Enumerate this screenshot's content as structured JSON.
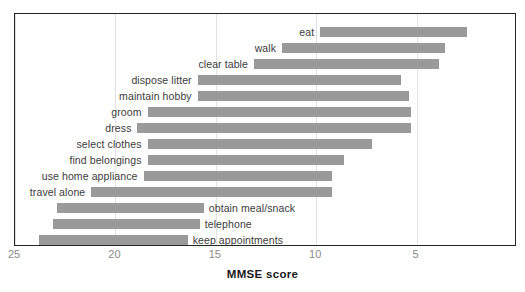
{
  "chart_data": {
    "type": "bar",
    "orientation": "horizontal-range",
    "title": "",
    "subtitle": "",
    "xlabel": "MMSE score",
    "ylabel": "",
    "xlim": [
      25,
      0
    ],
    "x_axis_reversed": true,
    "xticks": [
      25,
      20,
      15,
      10,
      5
    ],
    "xtick_labels": [
      "25",
      "20",
      "15",
      "10",
      "5"
    ],
    "grid": true,
    "grid_axis": "x",
    "legend": null,
    "bar_color": "#9a9a9a",
    "frame_color": "#262626",
    "gridline_color": "#e2e2e2",
    "categories": [
      "eat",
      "walk",
      "clear table",
      "dispose litter",
      "maintain hobby",
      "groom",
      "dress",
      "select clothes",
      "find belongings",
      "use home appliance",
      "travel alone",
      "obtain meal/snack",
      "telephone",
      "keep appointments"
    ],
    "bars": [
      {
        "label": "eat",
        "start": 9.8,
        "end": 2.5,
        "label_side": "left"
      },
      {
        "label": "walk",
        "start": 11.7,
        "end": 3.6,
        "label_side": "left"
      },
      {
        "label": "clear table",
        "start": 13.1,
        "end": 3.9,
        "label_side": "left"
      },
      {
        "label": "dispose litter",
        "start": 15.9,
        "end": 5.8,
        "label_side": "left"
      },
      {
        "label": "maintain hobby",
        "start": 15.9,
        "end": 5.4,
        "label_side": "left"
      },
      {
        "label": "groom",
        "start": 18.4,
        "end": 5.3,
        "label_side": "left"
      },
      {
        "label": "dress",
        "start": 18.9,
        "end": 5.3,
        "label_side": "left"
      },
      {
        "label": "select clothes",
        "start": 18.4,
        "end": 7.2,
        "label_side": "left"
      },
      {
        "label": "find belongings",
        "start": 18.4,
        "end": 8.6,
        "label_side": "left"
      },
      {
        "label": "use home appliance",
        "start": 18.6,
        "end": 9.2,
        "label_side": "left"
      },
      {
        "label": "travel alone",
        "start": 21.2,
        "end": 9.2,
        "label_side": "left"
      },
      {
        "label": "obtain meal/snack",
        "start": 22.9,
        "end": 15.6,
        "label_side": "right"
      },
      {
        "label": "telephone",
        "start": 23.1,
        "end": 15.8,
        "label_side": "right"
      },
      {
        "label": "keep appointments",
        "start": 23.8,
        "end": 16.4,
        "label_side": "right"
      }
    ]
  },
  "axis": {
    "title": "MMSE score",
    "ticks": [
      "25",
      "20",
      "15",
      "10",
      "5"
    ]
  }
}
